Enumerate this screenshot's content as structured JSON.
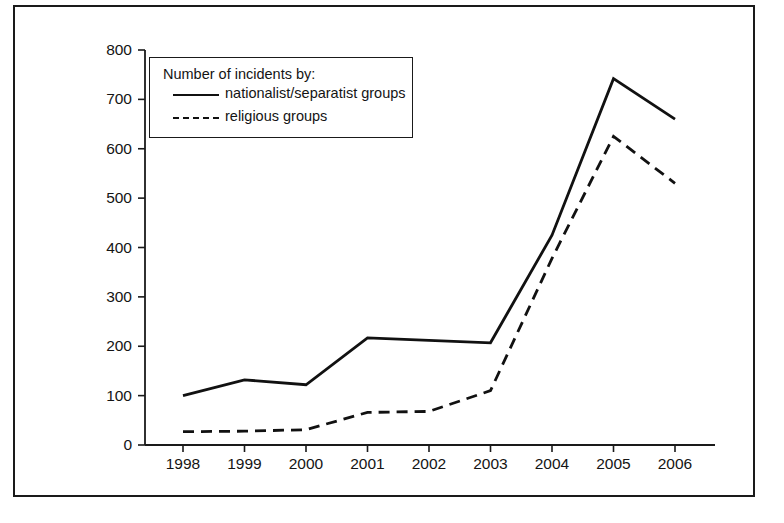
{
  "chart_data": {
    "type": "line",
    "title": "",
    "subtitle": "",
    "xlabel": "",
    "ylabel": "",
    "categories": [
      "1998",
      "1999",
      "2000",
      "2001",
      "2002",
      "2003",
      "2004",
      "2005",
      "2006"
    ],
    "series": [
      {
        "name": "nationalist/separatist groups",
        "style": "solid",
        "color": "#111111",
        "values": [
          100,
          132,
          122,
          217,
          212,
          207,
          425,
          742,
          660
        ]
      },
      {
        "name": "religious groups",
        "style": "dashed",
        "color": "#111111",
        "values": [
          27,
          28,
          31,
          66,
          68,
          110,
          378,
          625,
          530
        ]
      }
    ],
    "ylim": [
      0,
      800
    ],
    "yticks": [
      0,
      100,
      200,
      300,
      400,
      500,
      600,
      700,
      800
    ],
    "ytick_labels": [
      "0",
      "100",
      "200",
      "300",
      "400",
      "500",
      "600",
      "700",
      "800"
    ],
    "xtick_labels": [
      "1998",
      "1999",
      "2000",
      "2001",
      "2002",
      "2003",
      "2004",
      "2005",
      "2006"
    ],
    "grid": false,
    "legend_position": "upper-left",
    "legend_title": "Number of incidents by:"
  },
  "legend": {
    "title": "Number of incidents by:",
    "entries": [
      {
        "label": "nationalist/separatist groups",
        "style": "solid"
      },
      {
        "label": "religious groups",
        "style": "dashed"
      }
    ]
  },
  "axes": {
    "y_tick_labels": [
      "800",
      "700",
      "600",
      "500",
      "400",
      "300",
      "200",
      "100",
      "0"
    ],
    "x_tick_labels": [
      "1998",
      "1999",
      "2000",
      "2001",
      "2002",
      "2003",
      "2004",
      "2005",
      "2006"
    ]
  }
}
